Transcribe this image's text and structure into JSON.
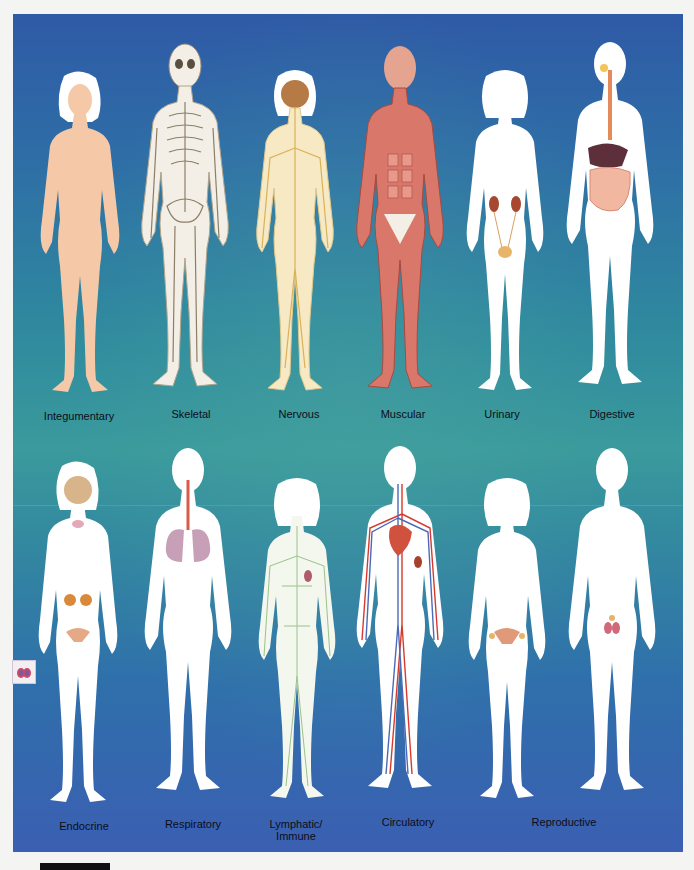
{
  "diagram": {
    "background_colors": {
      "top": "#2f5aa6",
      "middle": "#3a9a9c",
      "bottom": "#3b5fb2"
    },
    "rows": [
      {
        "figures": [
          {
            "label": "Integumentary",
            "sex": "female",
            "skin": "#f5c9a8"
          },
          {
            "label": "Skeletal",
            "sex": "male",
            "skin": "#f3efe6"
          },
          {
            "label": "Nervous",
            "sex": "female",
            "skin": "#f7e9c4"
          },
          {
            "label": "Muscular",
            "sex": "male",
            "skin": "#d9786a"
          },
          {
            "label": "Urinary",
            "sex": "female",
            "skin": "#ffffff"
          },
          {
            "label": "Digestive",
            "sex": "male",
            "skin": "#ffffff"
          }
        ]
      },
      {
        "figures": [
          {
            "label": "Endocrine",
            "sex": "female",
            "skin": "#ffffff"
          },
          {
            "label": "Respiratory",
            "sex": "male",
            "skin": "#ffffff"
          },
          {
            "label_line1": "Lymphatic/",
            "label_line2": "Immune",
            "sex": "female",
            "skin": "#ffffff"
          },
          {
            "label": "Circulatory",
            "sex": "male",
            "skin": "#ffffff"
          },
          {
            "label": "Reproductive",
            "sex": "female",
            "skin": "#ffffff"
          },
          {
            "sex": "male",
            "skin": "#ffffff"
          }
        ]
      }
    ],
    "inset_icon": "testes-icon"
  }
}
